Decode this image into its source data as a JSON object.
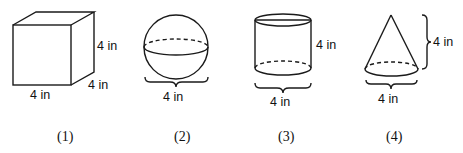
{
  "figures": [
    {
      "id": 1,
      "shape": "cube",
      "caption": "(1)",
      "dimensions": {
        "width": "4 in",
        "height": "4 in",
        "depth": "4 in"
      }
    },
    {
      "id": 2,
      "shape": "sphere",
      "caption": "(2)",
      "dimensions": {
        "diameter": "4 in"
      }
    },
    {
      "id": 3,
      "shape": "cylinder",
      "caption": "(3)",
      "dimensions": {
        "diameter": "4 in",
        "height": "4 in"
      }
    },
    {
      "id": 4,
      "shape": "cone",
      "caption": "(4)",
      "dimensions": {
        "diameter": "4 in",
        "height": "4 in"
      }
    }
  ]
}
